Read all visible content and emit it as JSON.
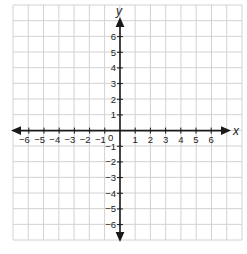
{
  "diagram": {
    "type": "coordinate-plane",
    "x_axis": {
      "label": "x",
      "min": -6,
      "max": 6,
      "ticks": [
        "−6",
        "−5",
        "−4",
        "−3",
        "−2",
        "−1",
        "1",
        "2",
        "3",
        "4",
        "5",
        "6"
      ]
    },
    "y_axis": {
      "label": "y",
      "min": -6,
      "max": 6,
      "ticks": [
        "6",
        "5",
        "4",
        "3",
        "2",
        "1",
        "−1",
        "−2",
        "−3",
        "−4",
        "−5",
        "−6"
      ]
    },
    "origin_label": "0",
    "grid": {
      "columns": 15,
      "rows": 15,
      "color": "#d2d2d2"
    },
    "axis_color": "#1a1a1a"
  }
}
